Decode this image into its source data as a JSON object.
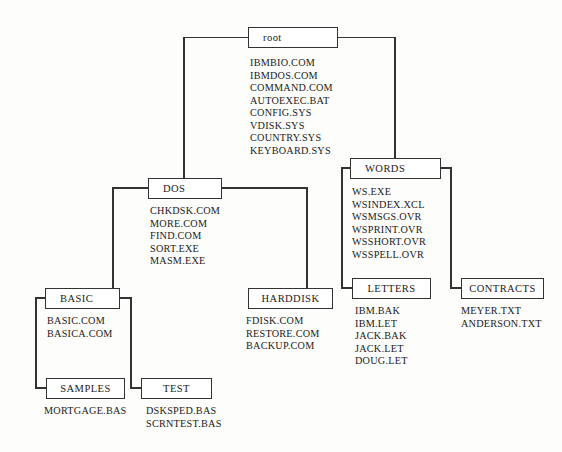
{
  "diagram": {
    "type": "directory-tree",
    "line_color": "#333333",
    "box_fill": "#ffffff",
    "text_color": "#1a1a1a",
    "background": "#fdfdfc"
  },
  "nodes": {
    "root": {
      "label": "root",
      "files": [
        "IBMBIO.COM",
        "IBMDOS.COM",
        "COMMAND.COM",
        "AUTOEXEC.BAT",
        "CONFIG.SYS",
        "VDISK.SYS",
        "COUNTRY.SYS",
        "KEYBOARD.SYS"
      ]
    },
    "dos": {
      "label": "DOS",
      "files": [
        "CHKDSK.COM",
        "MORE.COM",
        "FIND.COM",
        "SORT.EXE",
        "MASM.EXE"
      ]
    },
    "words": {
      "label": "WORDS",
      "files": [
        "WS.EXE",
        "WSINDEX.XCL",
        "WSMSGS.OVR",
        "WSPRINT.OVR",
        "WSSHORT.OVR",
        "WSSPELL.OVR"
      ]
    },
    "basic": {
      "label": "BASIC",
      "files": [
        "BASIC.COM",
        "BASICA.COM"
      ]
    },
    "harddisk": {
      "label": "HARDDISK",
      "files": [
        "FDISK.COM",
        "RESTORE.COM",
        "BACKUP.COM"
      ]
    },
    "letters": {
      "label": "LETTERS",
      "files": [
        "IBM.BAK",
        "IBM.LET",
        "JACK.BAK",
        "JACK.LET",
        "DOUG.LET"
      ]
    },
    "contracts": {
      "label": "CONTRACTS",
      "files": [
        "MEYER.TXT",
        "ANDERSON.TXT"
      ]
    },
    "samples": {
      "label": "SAMPLES",
      "files": [
        "MORTGAGE.BAS"
      ]
    },
    "test": {
      "label": "TEST",
      "files": [
        "DSKSPED.BAS",
        "SCRNTEST.BAS"
      ]
    }
  },
  "edges": [
    {
      "from": "root",
      "to": "dos"
    },
    {
      "from": "root",
      "to": "words"
    },
    {
      "from": "dos",
      "to": "basic"
    },
    {
      "from": "dos",
      "to": "harddisk"
    },
    {
      "from": "words",
      "to": "letters"
    },
    {
      "from": "words",
      "to": "contracts"
    },
    {
      "from": "basic",
      "to": "samples"
    },
    {
      "from": "basic",
      "to": "test"
    }
  ]
}
